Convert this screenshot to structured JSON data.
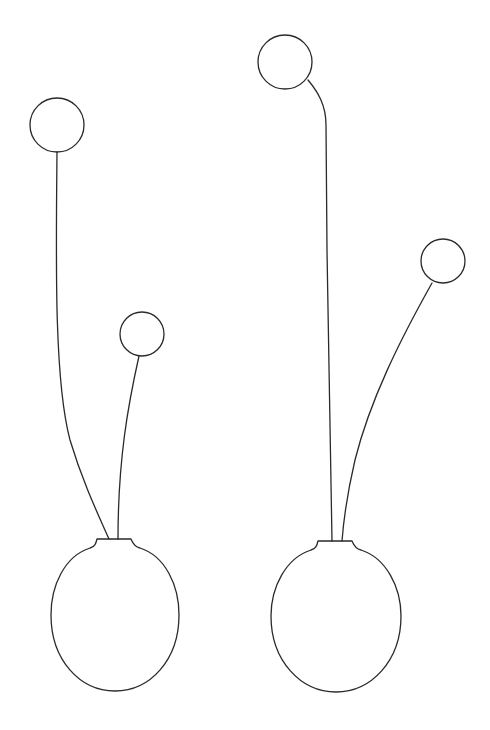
{
  "drawing": {
    "description": "Line drawing of two round vases, each holding two stems topped by circular flowers",
    "background_color": "#ffffff",
    "stroke_color": "#2a2a2a",
    "vases": [
      {
        "id": "left-vase",
        "neck": {
          "x1": 97,
          "x2": 131,
          "y": 539
        },
        "body": {
          "cx": 115,
          "cy": 615,
          "rx": 64,
          "ry": 76
        },
        "flowers": [
          {
            "id": "left-tall-flower",
            "cx": 57,
            "cy": 125,
            "r": 27
          },
          {
            "id": "left-short-flower",
            "cx": 142,
            "cy": 334,
            "r": 22
          }
        ]
      },
      {
        "id": "right-vase",
        "neck": {
          "x1": 318,
          "x2": 352,
          "y": 541
        },
        "body": {
          "cx": 336,
          "cy": 616,
          "rx": 65,
          "ry": 76
        },
        "flowers": [
          {
            "id": "right-tall-flower",
            "cx": 285,
            "cy": 62,
            "r": 27
          },
          {
            "id": "right-side-flower",
            "cx": 443,
            "cy": 261,
            "r": 22
          }
        ]
      }
    ]
  }
}
